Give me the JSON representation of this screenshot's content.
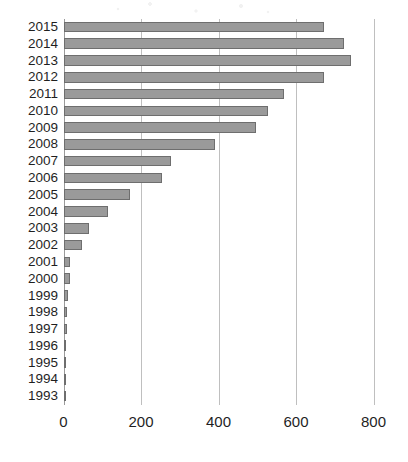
{
  "chart_data": {
    "type": "bar",
    "orientation": "horizontal",
    "title": "",
    "subtitle": "",
    "xlabel": "",
    "ylabel": "",
    "categories": [
      "2015",
      "2014",
      "2013",
      "2012",
      "2011",
      "2010",
      "2009",
      "2008",
      "2007",
      "2006",
      "2005",
      "2004",
      "2003",
      "2002",
      "2001",
      "2000",
      "1999",
      "1998",
      "1997",
      "1996",
      "1995",
      "1994",
      "1993"
    ],
    "values": [
      672,
      725,
      742,
      672,
      568,
      527,
      498,
      390,
      277,
      254,
      171,
      115,
      66,
      48,
      17,
      17,
      12,
      9,
      9,
      4,
      3,
      3,
      3
    ],
    "series": [
      {
        "name": "",
        "values": [
          672,
          725,
          742,
          672,
          568,
          527,
          498,
          390,
          277,
          254,
          171,
          115,
          66,
          48,
          17,
          17,
          12,
          9,
          9,
          4,
          3,
          3,
          3
        ]
      }
    ],
    "xlim": [
      0,
      800
    ],
    "xticks": [
      0,
      200,
      400,
      600,
      800
    ],
    "xtick_labels": [
      "0",
      "200",
      "400",
      "600",
      "800"
    ],
    "grid": "vertical",
    "legend": "none",
    "bar_fill_color": "#9a9a9a",
    "bar_border_color": "#6e6e6e",
    "gridline_color": "#bfbfbf",
    "axis_color": "#9a9a9a",
    "background_color": "#ffffff"
  }
}
